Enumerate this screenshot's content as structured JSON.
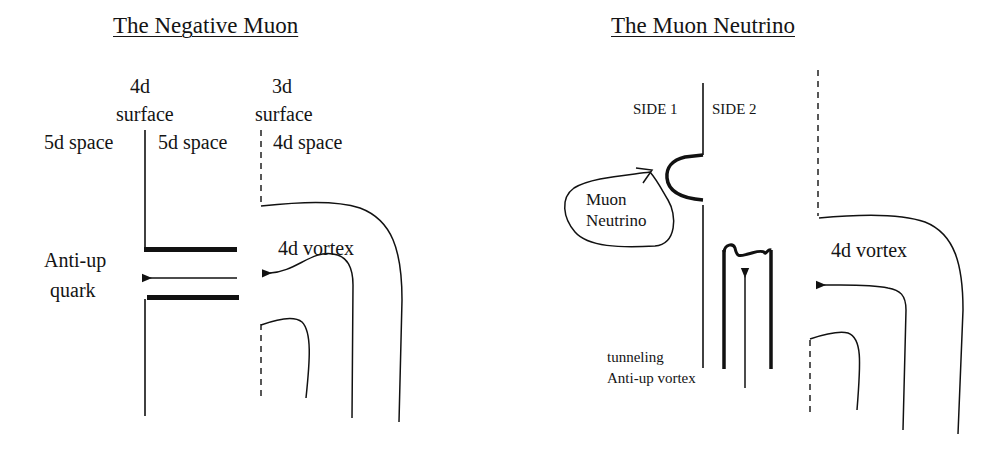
{
  "left_diagram": {
    "title": "The Negative Muon",
    "labels": {
      "surface_4d_line1": "4d",
      "surface_4d_line2": "surface",
      "surface_3d_line1": "3d",
      "surface_3d_line2": "surface",
      "space_left": "5d space",
      "space_middle": "5d space",
      "space_right": "4d space",
      "anti_up_line1": "Anti-up",
      "anti_up_line2": "quark",
      "vortex": "4d vortex"
    }
  },
  "right_diagram": {
    "title": "The Muon Neutrino",
    "labels": {
      "side1": "SIDE 1",
      "side2": "SIDE 2",
      "neutrino_line1": "Muon",
      "neutrino_line2": "Neutrino",
      "vortex": "4d vortex",
      "tunneling_line1": "tunneling",
      "tunneling_line2": "Anti-up vortex"
    }
  },
  "colors": {
    "ink": "#111111",
    "background": "#ffffff"
  }
}
